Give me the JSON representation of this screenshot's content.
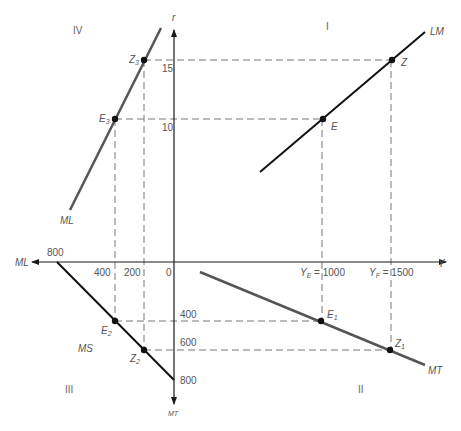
{
  "diagram": {
    "colors": {
      "axis": "#1a1a1a",
      "black_line": "#111111",
      "gray_line": "#555555",
      "dashed": "#777777",
      "text": "#555555"
    },
    "quadrants": {
      "I": "I",
      "II": "II",
      "III": "III",
      "IV": "IV"
    },
    "axes": {
      "vertical_up_label": "r",
      "vertical_down_label": "MT",
      "horizontal_right_label": "Y",
      "horizontal_left_label": "ML"
    },
    "ticks": {
      "r_15": "15",
      "r_10": "10",
      "origin": "0",
      "left_200": "200",
      "left_400": "400",
      "left_800": "800",
      "down_400": "400",
      "down_600": "600",
      "down_800": "800",
      "ye_main": "Y",
      "ye_sub": "E",
      "ye_value": " = 1000",
      "yf_main": "Y",
      "yf_sub": "F",
      "yf_value": " = 1500"
    },
    "lines": {
      "LM": "LM",
      "MT": "MT",
      "MS": "MS",
      "ML": "ML"
    },
    "points": {
      "E": {
        "main": "E",
        "sub": ""
      },
      "Z": {
        "main": "Z",
        "sub": ""
      },
      "E1": {
        "main": "E",
        "sub": "1"
      },
      "Z1": {
        "main": "Z",
        "sub": "1"
      },
      "E2": {
        "main": "E",
        "sub": "2"
      },
      "Z2": {
        "main": "Z",
        "sub": "2"
      },
      "E3": {
        "main": "E",
        "sub": "3"
      },
      "Z3": {
        "main": "Z",
        "sub": "3"
      }
    }
  }
}
